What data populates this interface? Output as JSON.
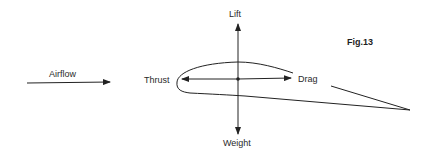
{
  "figure": {
    "caption": "Fig.13"
  },
  "labels": {
    "airflow": "Airflow",
    "lift": "Lift",
    "weight": "Weight",
    "thrust": "Thrust",
    "drag": "Drag"
  },
  "colors": {
    "stroke": "#222222",
    "background": "#ffffff"
  }
}
